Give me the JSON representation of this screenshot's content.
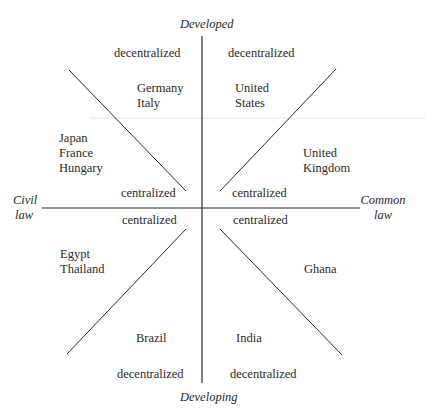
{
  "diagram": {
    "axes": {
      "top": "Developed",
      "bottom": "Developing",
      "left": [
        "Civil",
        "law"
      ],
      "right": [
        "Common",
        "law"
      ]
    },
    "zones": {
      "upper_left_outer": "decentralized",
      "upper_right_outer": "decentralized",
      "upper_left_inner": "centralized",
      "upper_right_inner": "centralized",
      "lower_left_inner": "centralized",
      "lower_right_inner": "centralized",
      "lower_left_outer": "decentralized",
      "lower_right_outer": "decentralized"
    },
    "countries": {
      "germany_italy": [
        "Germany",
        "Italy"
      ],
      "united_states": [
        "United",
        "States"
      ],
      "japan_france_hungary": [
        "Japan",
        "France",
        "Hungary"
      ],
      "united_kingdom": [
        "United",
        "Kingdom"
      ],
      "egypt_thailand": [
        "Egypt",
        "Thailand"
      ],
      "ghana": [
        "Ghana"
      ],
      "brazil": [
        "Brazil"
      ],
      "india": [
        "India"
      ]
    },
    "colors": {
      "line": "#2a2a2a",
      "text": "#2a2a2a",
      "artifact_line": "#e4e4e4",
      "background": "#ffffff"
    }
  }
}
